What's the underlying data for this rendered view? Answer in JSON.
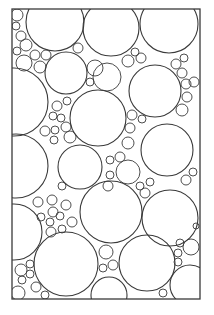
{
  "diagram": {
    "type": "circle-packing",
    "background": "#ffffff",
    "stroke": "#3a3a3a",
    "frame": {
      "x": 12,
      "y": 9,
      "width": 188,
      "height": 290
    },
    "circles": [
      {
        "cx": 55,
        "cy": 22,
        "r": 29
      },
      {
        "cx": 111,
        "cy": 28,
        "r": 28
      },
      {
        "cx": 169,
        "cy": 24,
        "r": 29
      },
      {
        "cx": 17,
        "cy": 15,
        "r": 6
      },
      {
        "cx": 16,
        "cy": 26,
        "r": 4
      },
      {
        "cx": 21,
        "cy": 36,
        "r": 5
      },
      {
        "cx": 26,
        "cy": 45,
        "r": 6
      },
      {
        "cx": 17,
        "cy": 51,
        "r": 4
      },
      {
        "cx": 35,
        "cy": 55,
        "r": 5
      },
      {
        "cx": 46,
        "cy": 55,
        "r": 5
      },
      {
        "cx": 24,
        "cy": 63,
        "r": 8
      },
      {
        "cx": 40,
        "cy": 67,
        "r": 6
      },
      {
        "cx": 78,
        "cy": 48,
        "r": 5
      },
      {
        "cx": 66,
        "cy": 73,
        "r": 21
      },
      {
        "cx": 95,
        "cy": 68,
        "r": 8
      },
      {
        "cx": 90,
        "cy": 82,
        "r": 4
      },
      {
        "cx": 107,
        "cy": 77,
        "r": 14
      },
      {
        "cx": 128,
        "cy": 61,
        "r": 6
      },
      {
        "cx": 135,
        "cy": 52,
        "r": 4
      },
      {
        "cx": 141,
        "cy": 58,
        "r": 5
      },
      {
        "cx": 155,
        "cy": 91,
        "r": 26
      },
      {
        "cx": 176,
        "cy": 64,
        "r": 5
      },
      {
        "cx": 184,
        "cy": 58,
        "r": 4
      },
      {
        "cx": 182,
        "cy": 73,
        "r": 5
      },
      {
        "cx": 186,
        "cy": 84,
        "r": 5
      },
      {
        "cx": 194,
        "cy": 82,
        "r": 5
      },
      {
        "cx": 187,
        "cy": 97,
        "r": 5
      },
      {
        "cx": 182,
        "cy": 110,
        "r": 6
      },
      {
        "cx": 14,
        "cy": 102,
        "r": 34
      },
      {
        "cx": 57,
        "cy": 106,
        "r": 5
      },
      {
        "cx": 67,
        "cy": 101,
        "r": 4
      },
      {
        "cx": 53,
        "cy": 116,
        "r": 4
      },
      {
        "cx": 61,
        "cy": 118,
        "r": 4
      },
      {
        "cx": 66,
        "cy": 127,
        "r": 5
      },
      {
        "cx": 45,
        "cy": 131,
        "r": 5
      },
      {
        "cx": 55,
        "cy": 130,
        "r": 4
      },
      {
        "cx": 54,
        "cy": 140,
        "r": 4
      },
      {
        "cx": 70,
        "cy": 137,
        "r": 6
      },
      {
        "cx": 98,
        "cy": 118,
        "r": 28
      },
      {
        "cx": 132,
        "cy": 115,
        "r": 5
      },
      {
        "cx": 142,
        "cy": 119,
        "r": 4
      },
      {
        "cx": 130,
        "cy": 128,
        "r": 5
      },
      {
        "cx": 128,
        "cy": 143,
        "r": 6
      },
      {
        "cx": 110,
        "cy": 160,
        "r": 4
      },
      {
        "cx": 120,
        "cy": 157,
        "r": 5
      },
      {
        "cx": 16,
        "cy": 166,
        "r": 32
      },
      {
        "cx": 80,
        "cy": 167,
        "r": 22
      },
      {
        "cx": 128,
        "cy": 172,
        "r": 12
      },
      {
        "cx": 110,
        "cy": 175,
        "r": 4
      },
      {
        "cx": 108,
        "cy": 186,
        "r": 5
      },
      {
        "cx": 167,
        "cy": 150,
        "r": 26
      },
      {
        "cx": 193,
        "cy": 172,
        "r": 4
      },
      {
        "cx": 186,
        "cy": 180,
        "r": 5
      },
      {
        "cx": 140,
        "cy": 186,
        "r": 4
      },
      {
        "cx": 150,
        "cy": 182,
        "r": 4
      },
      {
        "cx": 145,
        "cy": 193,
        "r": 5
      },
      {
        "cx": 38,
        "cy": 202,
        "r": 5
      },
      {
        "cx": 52,
        "cy": 200,
        "r": 5
      },
      {
        "cx": 62,
        "cy": 186,
        "r": 4
      },
      {
        "cx": 53,
        "cy": 212,
        "r": 5
      },
      {
        "cx": 66,
        "cy": 205,
        "r": 5
      },
      {
        "cx": 41,
        "cy": 217,
        "r": 4
      },
      {
        "cx": 50,
        "cy": 222,
        "r": 4
      },
      {
        "cx": 60,
        "cy": 216,
        "r": 4
      },
      {
        "cx": 72,
        "cy": 222,
        "r": 5
      },
      {
        "cx": 51,
        "cy": 232,
        "r": 5
      },
      {
        "cx": 62,
        "cy": 229,
        "r": 4
      },
      {
        "cx": 111,
        "cy": 212,
        "r": 31
      },
      {
        "cx": 170,
        "cy": 218,
        "r": 28
      },
      {
        "cx": 196,
        "cy": 226,
        "r": 3
      },
      {
        "cx": 14,
        "cy": 232,
        "r": 28
      },
      {
        "cx": 66,
        "cy": 264,
        "r": 32
      },
      {
        "cx": 106,
        "cy": 252,
        "r": 7
      },
      {
        "cx": 113,
        "cy": 265,
        "r": 5
      },
      {
        "cx": 103,
        "cy": 268,
        "r": 4
      },
      {
        "cx": 147,
        "cy": 263,
        "r": 28
      },
      {
        "cx": 180,
        "cy": 243,
        "r": 4
      },
      {
        "cx": 191,
        "cy": 247,
        "r": 8
      },
      {
        "cx": 178,
        "cy": 253,
        "r": 4
      },
      {
        "cx": 178,
        "cy": 262,
        "r": 4
      },
      {
        "cx": 21,
        "cy": 270,
        "r": 6
      },
      {
        "cx": 30,
        "cy": 264,
        "r": 4
      },
      {
        "cx": 30,
        "cy": 274,
        "r": 4
      },
      {
        "cx": 22,
        "cy": 280,
        "r": 4
      },
      {
        "cx": 36,
        "cy": 287,
        "r": 5
      },
      {
        "cx": 45,
        "cy": 295,
        "r": 4
      },
      {
        "cx": 18,
        "cy": 293,
        "r": 7
      },
      {
        "cx": 109,
        "cy": 295,
        "r": 18
      },
      {
        "cx": 163,
        "cy": 293,
        "r": 4
      },
      {
        "cx": 190,
        "cy": 285,
        "r": 20
      }
    ]
  }
}
